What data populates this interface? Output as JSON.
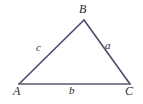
{
  "figure": {
    "kind": "geometry-diagram",
    "shape": "triangle",
    "background_color": "#ffffff",
    "canvas": {
      "width": 143,
      "height": 104
    }
  },
  "style": {
    "edge_color": "#4f4a6e",
    "base_edge_color": "#5d5a6b",
    "edge_width": 1.6,
    "label_color": "#2a2a2a"
  },
  "vertices": [
    {
      "name": "A",
      "label": "A",
      "x": 19,
      "y": 84,
      "label_x": 13,
      "label_y": 85
    },
    {
      "name": "B",
      "label": "B",
      "x": 84,
      "y": 20,
      "label_x": 79,
      "label_y": 3
    },
    {
      "name": "C",
      "label": "C",
      "x": 130,
      "y": 84,
      "label_x": 125,
      "label_y": 85
    }
  ],
  "sides": [
    {
      "name": "side-c",
      "label": "c",
      "from": "A",
      "to": "B",
      "label_x": 36,
      "label_y": 42
    },
    {
      "name": "side-a",
      "label": "a",
      "from": "B",
      "to": "C",
      "label_x": 105,
      "label_y": 40
    },
    {
      "name": "side-b",
      "label": "b",
      "from": "A",
      "to": "C",
      "label_x": 69,
      "label_y": 85
    }
  ]
}
